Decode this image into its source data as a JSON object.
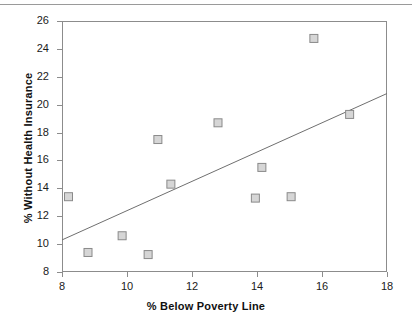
{
  "chart_data": {
    "type": "scatter",
    "title": "",
    "xlabel": "% Below Poverty Line",
    "ylabel": "% Without Health Insurance",
    "xlim": [
      8,
      18
    ],
    "ylim": [
      8,
      26
    ],
    "xticks": [
      8,
      10,
      12,
      14,
      16,
      18
    ],
    "yticks": [
      8,
      10,
      12,
      14,
      16,
      18,
      20,
      22,
      24,
      26
    ],
    "xtick_labels": [
      "8",
      "10",
      "12",
      "14",
      "16",
      "18"
    ],
    "ytick_labels": [
      "8",
      "10",
      "12",
      "14",
      "16",
      "18",
      "20",
      "22",
      "24",
      "26"
    ],
    "grid": false,
    "legend": null,
    "marker": {
      "shape": "square-open",
      "fill": "#d6d6d6",
      "edge": "#8a8a8a",
      "size": 8
    },
    "points": [
      {
        "x": 8.2,
        "y": 13.4
      },
      {
        "x": 8.8,
        "y": 9.4
      },
      {
        "x": 9.85,
        "y": 10.6
      },
      {
        "x": 10.65,
        "y": 9.25
      },
      {
        "x": 10.95,
        "y": 17.5
      },
      {
        "x": 11.35,
        "y": 14.3
      },
      {
        "x": 12.8,
        "y": 18.7
      },
      {
        "x": 13.95,
        "y": 13.3
      },
      {
        "x": 14.15,
        "y": 15.5
      },
      {
        "x": 15.05,
        "y": 13.4
      },
      {
        "x": 15.75,
        "y": 24.75
      },
      {
        "x": 16.85,
        "y": 19.3
      }
    ],
    "trendline": {
      "type": "linear",
      "color": "#6f6f6f",
      "x_start": 8,
      "y_start": 10.3,
      "x_end": 18,
      "y_end": 20.8
    }
  }
}
